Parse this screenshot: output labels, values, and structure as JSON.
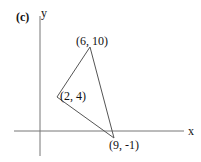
{
  "panel_label": "(c)",
  "axes": {
    "x_label": "x",
    "y_label": "y"
  },
  "triangle": {
    "vertices": [
      {
        "label": "(6, 10)",
        "x": 6,
        "y": 10
      },
      {
        "label": "(2, 4)",
        "x": 2,
        "y": 4
      },
      {
        "label": "(9, -1)",
        "x": 9,
        "y": -1
      }
    ]
  },
  "colors": {
    "line": "#555555",
    "axis": "#777777",
    "text": "#111111"
  }
}
